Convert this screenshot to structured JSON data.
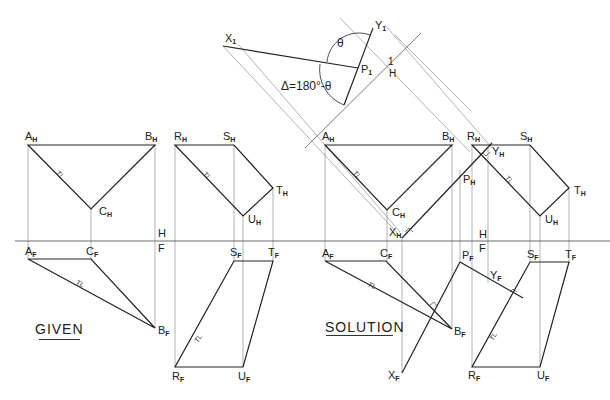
{
  "labels": {
    "given": "GIVEN",
    "solution": "SOLUTION",
    "angle_theta": "θ",
    "angle_delta": "Δ=180°-θ",
    "tl": "TL",
    "fold_hf_top": "H",
    "fold_hf_bottom": "F",
    "fold_1h_top": "1",
    "fold_1h_bottom": "H"
  },
  "points": {
    "given_top": [
      {
        "name": "A",
        "sub": "H"
      },
      {
        "name": "B",
        "sub": "H"
      },
      {
        "name": "C",
        "sub": "H"
      },
      {
        "name": "R",
        "sub": "H"
      },
      {
        "name": "S",
        "sub": "H"
      },
      {
        "name": "T",
        "sub": "H"
      },
      {
        "name": "U",
        "sub": "H"
      }
    ],
    "given_front": [
      {
        "name": "A",
        "sub": "F"
      },
      {
        "name": "C",
        "sub": "F"
      },
      {
        "name": "B",
        "sub": "F"
      },
      {
        "name": "S",
        "sub": "F"
      },
      {
        "name": "T",
        "sub": "F"
      },
      {
        "name": "R",
        "sub": "F"
      },
      {
        "name": "U",
        "sub": "F"
      }
    ],
    "solution_top": [
      {
        "name": "A",
        "sub": "H"
      },
      {
        "name": "B",
        "sub": "H"
      },
      {
        "name": "C",
        "sub": "H"
      },
      {
        "name": "R",
        "sub": "H"
      },
      {
        "name": "S",
        "sub": "H"
      },
      {
        "name": "T",
        "sub": "H"
      },
      {
        "name": "U",
        "sub": "H"
      },
      {
        "name": "X",
        "sub": "H"
      },
      {
        "name": "Y",
        "sub": "H"
      },
      {
        "name": "P",
        "sub": "H"
      }
    ],
    "solution_front": [
      {
        "name": "A",
        "sub": "F"
      },
      {
        "name": "C",
        "sub": "F"
      },
      {
        "name": "B",
        "sub": "F"
      },
      {
        "name": "P",
        "sub": "F"
      },
      {
        "name": "Y",
        "sub": "F"
      },
      {
        "name": "X",
        "sub": "F"
      },
      {
        "name": "S",
        "sub": "F"
      },
      {
        "name": "T",
        "sub": "F"
      },
      {
        "name": "R",
        "sub": "F"
      },
      {
        "name": "U",
        "sub": "F"
      }
    ],
    "aux_view": [
      {
        "name": "X",
        "sub": "1"
      },
      {
        "name": "Y",
        "sub": "1"
      },
      {
        "name": "P",
        "sub": "1"
      }
    ]
  }
}
